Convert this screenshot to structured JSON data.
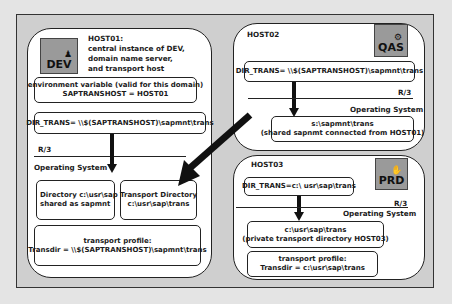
{
  "hosts": {
    "host01": {
      "title": "HOST01:",
      "description": [
        "central instance of DEV,",
        "domain name server,",
        "and transport host"
      ],
      "badge": {
        "label": "DEV",
        "icon": "person-icon"
      },
      "env_box": {
        "line1": "environment variable (valid for this domain)",
        "line2": "SAPTRANSHOST = HOST01"
      },
      "dir_trans": "DIR_TRANS= \\\\$(SAPTRANSHOST)\\sapmnt\\trans",
      "layer_r3": "R/3",
      "layer_os": "Operating System",
      "directory_box": {
        "line1": "Directory c:\\usr\\sap",
        "line2": "shared as sapmnt"
      },
      "transport_dir_box": {
        "line1": "Transport Directory",
        "line2": "c:\\usr\\sap\\trans"
      },
      "profile_box": {
        "line1": "transport profile:",
        "line2": "Transdir  = \\\\$(SAPTRANSHOST)\\sapmnt\\trans"
      }
    },
    "host02": {
      "title": "HOST02",
      "badge": {
        "label": "QAS",
        "icon": "tool-icon"
      },
      "dir_trans": "DIR_TRANS= \\\\$(SAPTRANSHOST)\\sapmnt\\trans",
      "layer_r3": "R/3",
      "layer_os": "Operating System",
      "share_box": {
        "line1": "s:\\sapmnt\\trans",
        "line2": "(shared sapnmt connected from HOST01)"
      }
    },
    "host03": {
      "title": "HOST03",
      "badge": {
        "label": "PRD",
        "icon": "hand-icon"
      },
      "dir_trans": "DIR_TRANS=c:\\ usr\\sap\\trans",
      "layer_r3": "R/3",
      "layer_os": "Operating System",
      "private_box": {
        "line1": "c:\\usr\\sap\\trans",
        "line2": "(private transport directory HOST03)"
      },
      "profile_box": {
        "line1": "transport profile:",
        "line2": "Transdir  = c:\\usr\\sap\\trans"
      }
    }
  },
  "icons": {
    "person-icon": "♟",
    "tool-icon": "⚙",
    "hand-icon": "✋"
  },
  "colors": {
    "frame_bg": "#cfcfcf",
    "badge_bg": "#9a9a9a",
    "outer_bg": "#e4e4e4"
  }
}
